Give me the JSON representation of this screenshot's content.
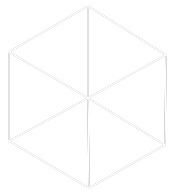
{
  "diagram": {
    "type": "hand-drawn hexagon (isometric cube outline) with spokes to center",
    "stroke_color": "#1a1a1a",
    "background": "#ffffff",
    "vertices": {
      "top": [
        88,
        6
      ],
      "upper_right": [
        166,
        55
      ],
      "lower_right": [
        165,
        145
      ],
      "bottom": [
        89,
        188
      ],
      "lower_left": [
        9,
        141
      ],
      "upper_left": [
        9,
        52
      ],
      "center": [
        88,
        98
      ]
    },
    "edges": [
      [
        "top",
        "upper_right"
      ],
      [
        "upper_right",
        "lower_right"
      ],
      [
        "lower_right",
        "bottom"
      ],
      [
        "bottom",
        "lower_left"
      ],
      [
        "lower_left",
        "upper_left"
      ],
      [
        "upper_left",
        "top"
      ],
      [
        "center",
        "top"
      ],
      [
        "center",
        "upper_right"
      ],
      [
        "center",
        "lower_right"
      ],
      [
        "center",
        "bottom"
      ],
      [
        "center",
        "lower_left"
      ],
      [
        "center",
        "upper_left"
      ]
    ]
  }
}
